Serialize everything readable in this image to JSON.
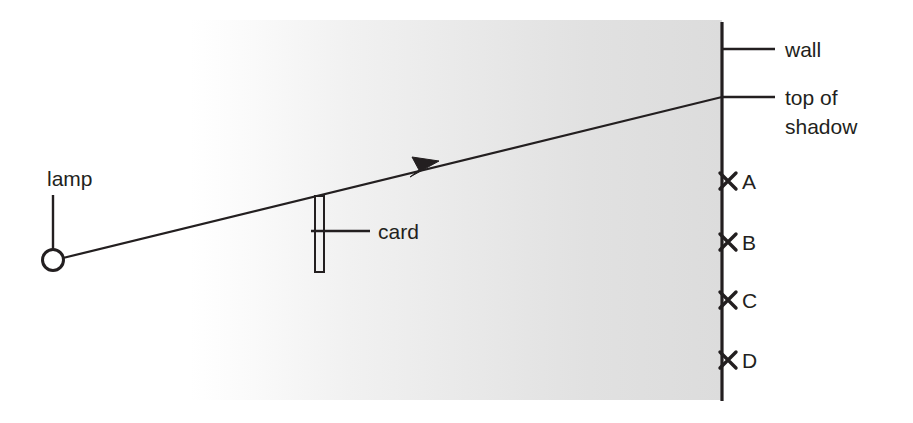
{
  "diagram": {
    "colors": {
      "ink": "#231f20",
      "shade_near_wall": "#dcdcdc",
      "shade_far": "#ffffff",
      "background": "#ffffff"
    },
    "labels": {
      "lamp": "lamp",
      "card": "card",
      "wall": "wall",
      "top_of_shadow_line1": "top of",
      "top_of_shadow_line2": "shadow"
    },
    "markers": [
      {
        "id": "marker-a",
        "label": "A",
        "glyph": "x-marker",
        "y": 181
      },
      {
        "id": "marker-b",
        "label": "B",
        "glyph": "x-marker",
        "y": 242
      },
      {
        "id": "marker-c",
        "label": "C",
        "glyph": "x-marker",
        "y": 300
      },
      {
        "id": "marker-d",
        "label": "D",
        "glyph": "x-marker",
        "y": 360
      }
    ],
    "geometry": {
      "lamp_center_x": 53,
      "lamp_center_y": 260,
      "lamp_radius": 10,
      "ray_end_x": 722,
      "ray_end_y": 97,
      "card_x": 315,
      "card_top_y": 196,
      "card_bottom_y": 272,
      "card_width": 9,
      "wall_x": 722,
      "wall_top_y": 22,
      "wall_bottom_y": 401,
      "shade_left_x": 190,
      "shade_top_y": 20,
      "shade_bottom_y": 400
    },
    "icons": {
      "lamp": "lamp-circle-icon",
      "arrow": "ray-arrowhead-icon",
      "marker": "x-marker-icon"
    }
  }
}
